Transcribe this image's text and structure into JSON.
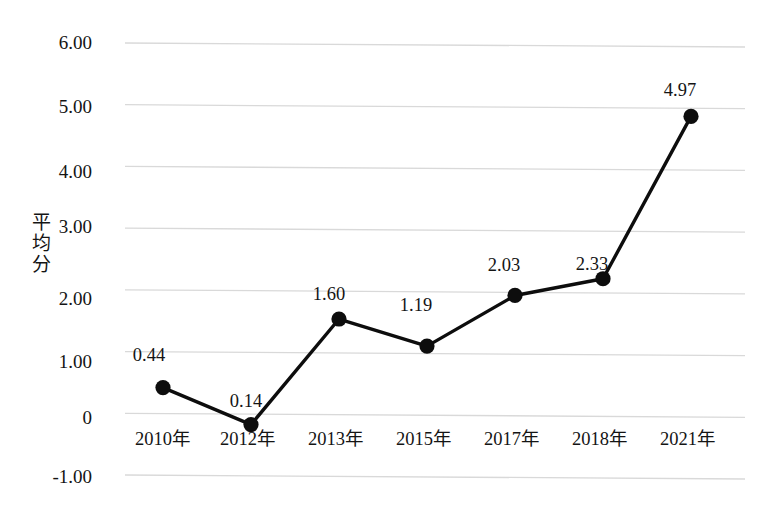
{
  "chart_data": {
    "type": "line",
    "title": "",
    "xlabel": "",
    "ylabel": "平均分",
    "categories": [
      "2010年",
      "2012年",
      "2013年",
      "2015年",
      "2017年",
      "2018年",
      "2021年"
    ],
    "values": [
      0.44,
      0.14,
      1.6,
      1.19,
      2.03,
      2.33,
      4.97
    ],
    "plotted_values": [
      0.42,
      -0.17,
      1.55,
      1.12,
      1.95,
      2.23,
      4.87
    ],
    "point_labels": [
      "0.44",
      "0.14",
      "1.60",
      "1.19",
      "2.03",
      "2.33",
      "4.97"
    ],
    "ylim": [
      -1.0,
      6.0
    ],
    "yticks": [
      6.0,
      5.0,
      4.0,
      3.0,
      2.0,
      1.0,
      0,
      -1.0
    ],
    "ytick_labels": [
      "6.00",
      "5.00",
      "4.00",
      "3.00",
      "2.00",
      "1.00",
      "0",
      "-1.00"
    ],
    "grid": true,
    "legend": false,
    "series_color": "#0d0d0d",
    "grid_color": "#d9d9d9",
    "marker": "circle"
  },
  "figure": {
    "caption_partial": ""
  }
}
